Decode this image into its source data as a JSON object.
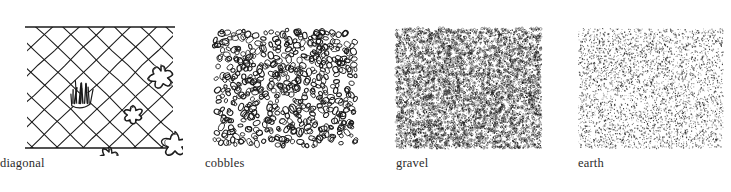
{
  "figure": {
    "background_color": "#ffffff",
    "ink_color": "#1a1a1a",
    "label_color": "#2b2b2b",
    "panel_count": 4
  },
  "panels": [
    {
      "id": "diagonal",
      "label": "diagonal",
      "texture_type": "diagonal-hatch-with-shrubs",
      "x": 27,
      "y": 27,
      "width": 146,
      "height": 121,
      "border": "top-and-bottom-rules-only",
      "grid_spacing": 26,
      "grid_angle_deg": 45,
      "motifs": [
        {
          "kind": "grass-tuft",
          "cx": 54,
          "cy": 70,
          "r": 14
        },
        {
          "kind": "shrub",
          "cx": 134,
          "cy": 50,
          "r": 13
        },
        {
          "kind": "shrub",
          "cx": 106,
          "cy": 88,
          "r": 10
        },
        {
          "kind": "shrub",
          "cx": 82,
          "cy": 130,
          "r": 10
        },
        {
          "kind": "shrub",
          "cx": 148,
          "cy": 118,
          "r": 13
        }
      ]
    },
    {
      "id": "cobbles",
      "label": "cobbles",
      "texture_type": "packed-ovals",
      "x": 213,
      "y": 28,
      "width": 145,
      "height": 120,
      "border": "none",
      "element_shape": "ellipse-outline",
      "element_count": 520,
      "element_size_px": [
        3.0,
        5.2
      ],
      "density": "dense"
    },
    {
      "id": "gravel",
      "label": "gravel",
      "texture_type": "fine-speckle",
      "x": 396,
      "y": 28,
      "width": 145,
      "height": 120,
      "border": "none",
      "element_shape": "tiny-dot-cluster",
      "element_count": 6200,
      "element_size_px": [
        0.7,
        1.9
      ],
      "density": "very-dense"
    },
    {
      "id": "earth",
      "label": "earth",
      "texture_type": "stipple",
      "x": 578,
      "y": 28,
      "width": 145,
      "height": 120,
      "border": "none",
      "element_shape": "point",
      "element_count": 3800,
      "element_size_px": [
        0.6,
        1.3
      ],
      "density": "medium"
    }
  ],
  "labels": {
    "diagonal": "diagonal",
    "cobbles": "cobbles",
    "gravel": "gravel",
    "earth": "earth"
  }
}
